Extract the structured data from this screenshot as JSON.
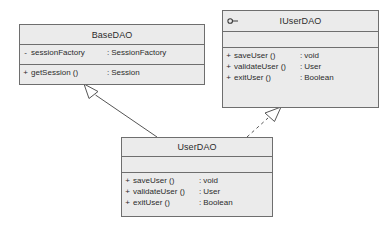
{
  "diagram": {
    "background_color": "#ffffff",
    "box_fill_color": "#ebebeb",
    "box_border_color": "#6e6e6e",
    "line_color": "#555555",
    "classes": [
      {
        "id": "basedao",
        "name": "BaseDAO",
        "stereotype_icon": "",
        "attributes": [
          {
            "visibility": "-",
            "name": "sessionFactory",
            "separator": ":",
            "type": "SessionFactory"
          }
        ],
        "operations": [
          {
            "visibility": "+",
            "name": "getSession ()",
            "separator": ":",
            "type": "Session"
          }
        ]
      },
      {
        "id": "iuserdao",
        "name": "IUserDAO",
        "stereotype_icon": "interface-lollipop-icon",
        "attributes": [],
        "operations": [
          {
            "visibility": "+",
            "name": "saveUser ()",
            "separator": ":",
            "type": "void"
          },
          {
            "visibility": "+",
            "name": "validateUser ()",
            "separator": ":",
            "type": "User"
          },
          {
            "visibility": "+",
            "name": "exitUser ()",
            "separator": ":",
            "type": "Boolean"
          }
        ]
      },
      {
        "id": "userdao",
        "name": "UserDAO",
        "stereotype_icon": "",
        "attributes": [],
        "operations": [
          {
            "visibility": "+",
            "name": "saveUser ()",
            "separator": ":",
            "type": "void"
          },
          {
            "visibility": "+",
            "name": "validateUser ()",
            "separator": ":",
            "type": "User"
          },
          {
            "visibility": "+",
            "name": "exitUser ()",
            "separator": ":",
            "type": "Boolean"
          }
        ]
      }
    ],
    "relationships": [
      {
        "id": "generalization-userdao-basedao",
        "kind": "generalization",
        "style": "solid",
        "arrowhead": "hollow-triangle",
        "from": "UserDAO",
        "to": "BaseDAO"
      },
      {
        "id": "realization-userdao-iuserdao",
        "kind": "realization",
        "style": "dashed",
        "arrowhead": "hollow-triangle",
        "from": "UserDAO",
        "to": "IUserDAO"
      }
    ]
  }
}
